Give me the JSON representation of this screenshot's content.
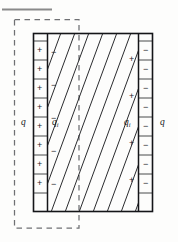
{
  "figure": {
    "caption_rule": "horizontal-rule",
    "colors": {
      "ink": "#17181a",
      "plate_stroke": "#141518",
      "hatch": "#2a2b2e",
      "dashed": "#6f7073",
      "rule": "#8a8a8a",
      "background": "#fdfdfc"
    },
    "geometry": {
      "main_rect": {
        "x": 33,
        "y": 33,
        "w": 120,
        "h": 179
      },
      "left_plate": {
        "x": 33,
        "y": 33,
        "w": 14,
        "h": 179
      },
      "right_plate": {
        "x": 139,
        "y": 33,
        "w": 14,
        "h": 179
      },
      "dielectric": {
        "x": 47,
        "y": 33,
        "w": 92,
        "h": 179
      },
      "gauss_box": {
        "x": 14,
        "y": 19,
        "w": 65,
        "h": 209
      },
      "top_rule": {
        "x": 2,
        "y": 9,
        "w": 50,
        "h": 2
      }
    },
    "labels": {
      "free_charge_left": "q",
      "free_charge_right": "q",
      "induced_charge_left": "q",
      "induced_charge_left_sub": "i",
      "induced_charge_right": "q",
      "induced_charge_right_sub": "i"
    },
    "left_plate_charges": {
      "symbol": "+",
      "count": 8,
      "y_positions": [
        50,
        69,
        88,
        107,
        126,
        145,
        164,
        183
      ]
    },
    "right_plate_charges": {
      "symbol": "−",
      "count": 8,
      "y_positions": [
        50,
        69,
        88,
        107,
        126,
        145,
        164,
        183
      ]
    },
    "dielectric_left_face_charges": {
      "symbol": "−",
      "count": 5,
      "y_positions": [
        52,
        85,
        118,
        151,
        184
      ]
    },
    "dielectric_right_face_charges": {
      "symbol": "+",
      "count": 4,
      "y_positions": [
        59,
        96,
        143,
        180
      ]
    },
    "hatching": {
      "angle_deg": 55,
      "line_count": 13,
      "stroke_width": 1.0
    },
    "plate_ticks": {
      "left_count": 9,
      "right_count": 9
    }
  }
}
